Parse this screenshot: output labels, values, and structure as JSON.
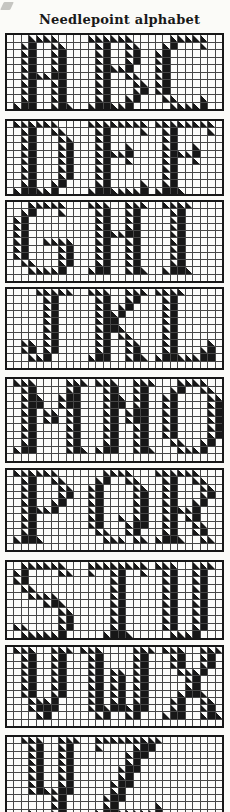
{
  "page": {
    "title": "Needlepoint alphabet",
    "ink_color": "#171717",
    "grid_line_color": "#474747",
    "paper_color": "#fbfbf8"
  },
  "chart_data": {
    "type": "heatmap",
    "title": "Needlepoint alphabet",
    "grid_columns": 29,
    "legend": {
      "empty": ".",
      "full_stitch": "#",
      "half_stitch_rendered_on_stroke_edges": true
    }
  },
  "letters": {
    "A": [
      "..####..",
      ".##..##.",
      ".##..##.",
      ".##..##.",
      ".##..##.",
      ".######.",
      ".##..##.",
      ".##..##.",
      ".##..##.",
      "###..###"
    ],
    "B": [
      "######..",
      ".##..##.",
      ".##..##.",
      ".##..##.",
      ".#####..",
      ".##..##.",
      ".##...##",
      ".##...##",
      ".##..##.",
      "######.."
    ],
    "C": [
      "..#####.",
      ".##...#.",
      "##......",
      "##......",
      "##......",
      "##......",
      "##......",
      "##......",
      ".##...#.",
      "..#####."
    ],
    "D": [
      "######..",
      ".##..##.",
      ".##...##",
      ".##...##",
      ".##...##",
      ".##...##",
      ".##...##",
      ".##...##",
      ".##..##.",
      "######.."
    ],
    "E": [
      "########",
      ".##....#",
      ".##.....",
      ".##..#..",
      ".#####..",
      ".##..#..",
      ".##.....",
      ".##.....",
      ".##....#",
      "########"
    ],
    "F": [
      "########",
      ".##....#",
      ".##.....",
      ".##..#..",
      ".#####..",
      ".##..#..",
      ".##.....",
      ".##.....",
      ".##.....",
      "####...."
    ],
    "G": [
      "..#####.",
      ".##...#.",
      "##......",
      "##......",
      "##......",
      "##..####",
      "##....##",
      "##....##",
      ".##...##",
      "..#####."
    ],
    "H": [
      "###..###",
      ".##..##.",
      ".##..##.",
      ".##..##.",
      ".######.",
      ".##..##.",
      ".##..##.",
      ".##..##.",
      ".##..##.",
      "###..###"
    ],
    "I": [
      "####",
      ".##.",
      ".##.",
      ".##.",
      ".##.",
      ".##.",
      ".##.",
      ".##.",
      ".##.",
      "####"
    ],
    "J": [
      "..#####",
      "...##..",
      "...##..",
      "...##..",
      "...##..",
      "...##..",
      "...##..",
      "##.##..",
      "##.##..",
      ".###..."
    ],
    "K": [
      "###..###",
      ".##..##.",
      ".##.##..",
      ".####...",
      ".###....",
      ".####...",
      ".##.##..",
      ".##..##.",
      ".##..##.",
      "###..###"
    ],
    "L": [
      "####....",
      ".##.....",
      ".##.....",
      ".##.....",
      ".##.....",
      ".##.....",
      ".##.....",
      ".##....#",
      ".##...##",
      "########"
    ],
    "M": [
      "###....###",
      ".##....##.",
      ".###..###.",
      ".###..###.",
      ".##.##.##.",
      ".##.##.##.",
      ".##....##.",
      ".##....##.",
      ".##....##.",
      "###....###"
    ],
    "N": [
      "###..###",
      ".##..##.",
      ".###.##.",
      ".###.##.",
      ".##.###.",
      ".##.###.",
      ".##..##.",
      ".##..##.",
      ".##..##.",
      "###..###"
    ],
    "O": [
      "..####..",
      ".##..##.",
      "##....##",
      "##....##",
      "##....##",
      "##....##",
      "##....##",
      "##....##",
      ".##..##.",
      "..####.."
    ],
    "P": [
      "######..",
      ".##..##.",
      ".##...##",
      ".##...##",
      ".##..##.",
      ".#####..",
      ".##.....",
      ".##.....",
      ".##.....",
      "####...."
    ],
    "Q": [
      "..####..",
      ".##..##.",
      "##....##",
      "##....##",
      "##....##",
      "##....##",
      "##..#.##",
      "##...###",
      ".##..##.",
      "..###.##"
    ],
    "R": [
      "######..",
      ".##..##.",
      ".##...##",
      ".##...##",
      ".##..##.",
      ".#####..",
      ".##.##..",
      ".##..##.",
      ".##..##.",
      "####..##"
    ],
    "S": [
      ".######.",
      "##....##",
      "##......",
      ".##.....",
      "..####..",
      "....###.",
      "......##",
      "......##",
      "##....##",
      ".######."
    ],
    "T": [
      "########",
      "#..##..#",
      "...##...",
      "...##...",
      "...##...",
      "...##...",
      "...##...",
      "...##...",
      "...##...",
      "..####.."
    ],
    "U": [
      "###..###",
      ".##..##.",
      ".##..##.",
      ".##..##.",
      ".##..##.",
      ".##..##.",
      ".##..##.",
      ".##..##.",
      ".##..##.",
      "..####.."
    ],
    "V": [
      "###..###",
      ".##..##.",
      ".##..##.",
      ".##..##.",
      ".##..##.",
      ".##..##.",
      ".##..##.",
      "..####..",
      "..####..",
      "...##..."
    ],
    "W": [
      "###....###",
      ".##....##.",
      ".##....##.",
      ".##.##.##.",
      ".##.##.##.",
      ".##.##.##.",
      ".##.##.##.",
      ".##.##.##.",
      ".########.",
      "..##..##.."
    ],
    "X": [
      "###..###",
      ".##..##.",
      ".##..##.",
      "..####...",
      "...##...",
      "...##...",
      "..####..",
      ".##..##.",
      ".##..##.",
      "###..###"
    ],
    "Y": [
      "###..###",
      ".##..##.",
      ".##..##.",
      ".##..##.",
      ".##..##.",
      ".##..##.",
      ".##..##.",
      ".######.",
      "....##..",
      "....##..",
      ".#..##..",
      "..####.."
    ],
    "Z": [
      "#########",
      "#....###.",
      "....###..",
      "....##...",
      "...###...",
      "...##....",
      "..###....",
      "..##.....",
      ".###.....",
      ".##.....#",
      "#########",
      "#########"
    ]
  },
  "blocks": [
    {
      "name": "ABC",
      "rows": 10,
      "letters": [
        {
          "ch": "A",
          "col": 1
        },
        {
          "ch": "B",
          "col": 11
        },
        {
          "ch": "C",
          "col": 20
        }
      ]
    },
    {
      "name": "DEF",
      "rows": 10,
      "letters": [
        {
          "ch": "D",
          "col": 1
        },
        {
          "ch": "E",
          "col": 11
        },
        {
          "ch": "F",
          "col": 20
        }
      ]
    },
    {
      "name": "GHI",
      "rows": 11,
      "letters": [
        {
          "ch": "G",
          "col": 1
        },
        {
          "ch": "H",
          "col": 11
        },
        {
          "ch": "I",
          "col": 21
        }
      ]
    },
    {
      "name": "JKL",
      "rows": 11,
      "letters": [
        {
          "ch": "J",
          "col": 2
        },
        {
          "ch": "K",
          "col": 11
        },
        {
          "ch": "L",
          "col": 20
        }
      ]
    },
    {
      "name": "MNO",
      "rows": 11,
      "letters": [
        {
          "ch": "M",
          "col": 1
        },
        {
          "ch": "N",
          "col": 12
        },
        {
          "ch": "O",
          "col": 21
        }
      ]
    },
    {
      "name": "PQR",
      "rows": 11,
      "letters": [
        {
          "ch": "P",
          "col": 1
        },
        {
          "ch": "Q",
          "col": 11
        },
        {
          "ch": "R",
          "col": 20
        }
      ]
    },
    {
      "name": "STU",
      "rows": 10,
      "letters": [
        {
          "ch": "S",
          "col": 1
        },
        {
          "ch": "T",
          "col": 11
        },
        {
          "ch": "U",
          "col": 20
        }
      ]
    },
    {
      "name": "VWX",
      "rows": 11,
      "letters": [
        {
          "ch": "V",
          "col": 1
        },
        {
          "ch": "W",
          "col": 10
        },
        {
          "ch": "X",
          "col": 21
        }
      ]
    },
    {
      "name": "YZ",
      "rows": 12,
      "letters": [
        {
          "ch": "Y",
          "col": 2
        },
        {
          "ch": "Z",
          "col": 12
        }
      ],
      "clipped_at_page_bottom": true
    }
  ]
}
